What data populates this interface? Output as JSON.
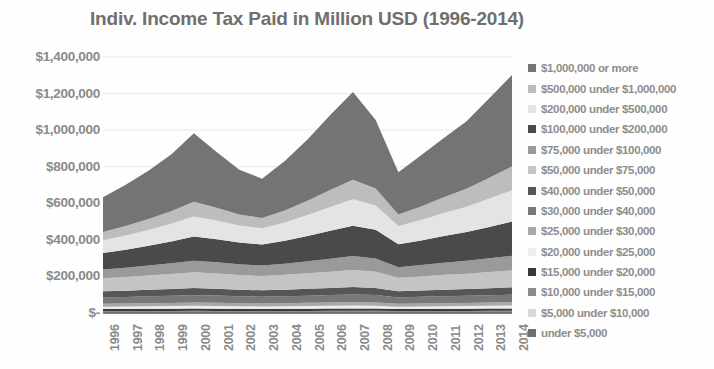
{
  "chart": {
    "title": "Indiv. Income Tax Paid in Million USD (1996-2014)"
  },
  "chart_data": {
    "type": "area",
    "title": "Indiv. Income Tax Paid in Million USD (1996-2014)",
    "xlabel": "",
    "ylabel": "",
    "stacked": true,
    "grid": true,
    "legend_position": "right",
    "ylim": [
      0,
      1400000
    ],
    "ytick_labels": [
      "$1,400,000",
      "$1,200,000",
      "$1,000,000",
      "$800,000",
      "$600,000",
      "$400,000",
      "$200,000",
      "$-"
    ],
    "ytick_values": [
      1400000,
      1200000,
      1000000,
      800000,
      600000,
      400000,
      200000,
      0
    ],
    "categories": [
      "1996",
      "1997",
      "1998",
      "1999",
      "2000",
      "2001",
      "2002",
      "2003",
      "2004",
      "2005",
      "2006",
      "2007",
      "2008",
      "2009",
      "2010",
      "2011",
      "2012",
      "2013",
      "2014"
    ],
    "series": [
      {
        "name": "under $5,000",
        "color": "#6e6e6e",
        "values": [
          1200,
          1250,
          1300,
          1350,
          1400,
          1350,
          1300,
          1250,
          1300,
          1350,
          1400,
          1450,
          1400,
          1200,
          1250,
          1300,
          1350,
          1400,
          1450
        ]
      },
      {
        "name": "$5,000 under $10,000",
        "color": "#d9d9d9",
        "values": [
          2600,
          2700,
          2800,
          2900,
          3000,
          2900,
          2800,
          2700,
          2800,
          2900,
          3000,
          3100,
          3000,
          2600,
          2700,
          2800,
          2900,
          3000,
          3100
        ]
      },
      {
        "name": "$10,000 under $15,000",
        "color": "#8c8c8c",
        "values": [
          6500,
          6700,
          6900,
          7100,
          7400,
          7200,
          6900,
          6700,
          6900,
          7100,
          7400,
          7600,
          7400,
          6500,
          6700,
          6900,
          7100,
          7300,
          7600
        ]
      },
      {
        "name": "$15,000 under $20,000",
        "color": "#3a3a3a",
        "values": [
          11000,
          11300,
          11700,
          12000,
          12500,
          12100,
          11700,
          11400,
          11700,
          12100,
          12500,
          12900,
          12500,
          11000,
          11300,
          11700,
          12000,
          12400,
          12800
        ]
      },
      {
        "name": "$20,000 under $25,000",
        "color": "#ededed",
        "values": [
          13500,
          13900,
          14300,
          14800,
          15300,
          14900,
          14400,
          14000,
          14400,
          14900,
          15300,
          15800,
          15300,
          13500,
          13900,
          14300,
          14800,
          15200,
          15700
        ]
      },
      {
        "name": "$25,000 under $30,000",
        "color": "#a8a8a8",
        "values": [
          15500,
          16000,
          16500,
          17000,
          17600,
          17100,
          16600,
          16100,
          16600,
          17100,
          17600,
          18200,
          17600,
          15500,
          16000,
          16500,
          17000,
          17500,
          18100
        ]
      },
      {
        "name": "$30,000 under $40,000",
        "color": "#787878",
        "values": [
          35000,
          36000,
          37500,
          39000,
          40500,
          39500,
          38000,
          37000,
          38000,
          39500,
          41000,
          42500,
          41000,
          35000,
          36500,
          38000,
          39000,
          40500,
          42000
        ]
      },
      {
        "name": "$40,000 under $50,000",
        "color": "#565656",
        "values": [
          33000,
          34000,
          35500,
          37000,
          38500,
          37500,
          36000,
          35000,
          36000,
          37500,
          39000,
          40500,
          39000,
          33000,
          34500,
          36000,
          37000,
          38500,
          40000
        ]
      },
      {
        "name": "$50,000 under $75,000",
        "color": "#c4c4c4",
        "values": [
          72000,
          75000,
          78000,
          82000,
          86000,
          83000,
          80000,
          78000,
          81000,
          85000,
          89000,
          93000,
          89000,
          74000,
          77000,
          81000,
          84000,
          88000,
          92000
        ]
      },
      {
        "name": "$75,000 under $100,000",
        "color": "#9a9a9a",
        "values": [
          48000,
          51000,
          55000,
          59000,
          64000,
          62000,
          59000,
          57000,
          61000,
          66000,
          71000,
          76000,
          72000,
          58000,
          62000,
          66000,
          70000,
          75000,
          80000
        ]
      },
      {
        "name": "$100,000 under $200,000",
        "color": "#4a4a4a",
        "values": [
          90000,
          98000,
          108000,
          119000,
          132000,
          126000,
          119000,
          115000,
          125000,
          138000,
          152000,
          166000,
          157000,
          125000,
          135000,
          147000,
          158000,
          172000,
          187000
        ]
      },
      {
        "name": "$200,000 under $500,000",
        "color": "#e4e4e4",
        "values": [
          70000,
          78000,
          87000,
          97000,
          110000,
          102000,
          93000,
          89000,
          100000,
          114000,
          130000,
          145000,
          133000,
          101000,
          112000,
          125000,
          138000,
          155000,
          172000
        ]
      },
      {
        "name": "$500,000 under $1,000,000",
        "color": "#bdbdbd",
        "values": [
          45000,
          52000,
          59000,
          68000,
          80000,
          70000,
          60000,
          56000,
          66000,
          79000,
          93000,
          106000,
          92000,
          63000,
          74000,
          86000,
          98000,
          114000,
          130000
        ]
      },
      {
        "name": "$1,000,000 or more",
        "color": "#747474",
        "values": [
          190000,
          225000,
          265000,
          310000,
          375000,
          305000,
          245000,
          215000,
          270000,
          335000,
          410000,
          480000,
          375000,
          230000,
          280000,
          325000,
          370000,
          435000,
          500000
        ]
      }
    ]
  },
  "legend": {
    "items": [
      {
        "label": "$1,000,000 or more",
        "color": "#747474"
      },
      {
        "label": "$500,000 under $1,000,000",
        "color": "#bdbdbd"
      },
      {
        "label": "$200,000 under $500,000",
        "color": "#e4e4e4"
      },
      {
        "label": "$100,000 under $200,000",
        "color": "#4a4a4a"
      },
      {
        "label": "$75,000 under $100,000",
        "color": "#9a9a9a"
      },
      {
        "label": "$50,000 under $75,000",
        "color": "#c4c4c4"
      },
      {
        "label": "$40,000 under $50,000",
        "color": "#565656"
      },
      {
        "label": "$30,000 under $40,000",
        "color": "#787878"
      },
      {
        "label": "$25,000 under $30,000",
        "color": "#a8a8a8"
      },
      {
        "label": "$20,000 under $25,000",
        "color": "#ededed"
      },
      {
        "label": "$15,000 under $20,000",
        "color": "#3a3a3a"
      },
      {
        "label": "$10,000 under $15,000",
        "color": "#8c8c8c"
      },
      {
        "label": "$5,000 under $10,000",
        "color": "#d9d9d9"
      },
      {
        "label": "under $5,000",
        "color": "#6e6e6e"
      }
    ]
  }
}
